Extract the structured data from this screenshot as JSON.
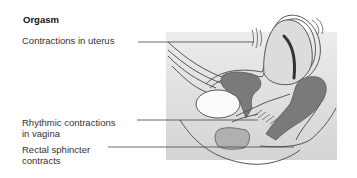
{
  "diagram": {
    "title": "Orgasm",
    "labels": [
      {
        "text": "Contractions in uterus"
      },
      {
        "line1": "Rhythmic contractions",
        "line2": "in vagina"
      },
      {
        "line1": "Rectal sphincter",
        "line2": "contracts"
      }
    ],
    "colors": {
      "background": "#ffffff",
      "panel": "#e4e4e4",
      "panel_shadow": "#cfcfcf",
      "organ_light": "#d9d9d9",
      "organ_dark": "#7a7a7a",
      "outline": "#555555",
      "leader_line": "#444444"
    }
  }
}
